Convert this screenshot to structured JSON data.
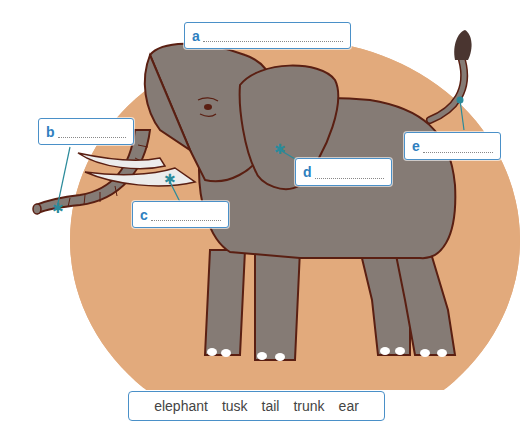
{
  "colors": {
    "background_circle": "#e2aa7c",
    "elephant_body": "#857b75",
    "outline": "#5a1f12",
    "tusk": "#ececec",
    "pointer": "#2a8a9a",
    "label_border": "#4a90c8",
    "label_letter": "#2f7fbf"
  },
  "labels": [
    {
      "letter": "a",
      "target": "whole animal"
    },
    {
      "letter": "b",
      "target": "trunk"
    },
    {
      "letter": "c",
      "target": "tusk"
    },
    {
      "letter": "d",
      "target": "ear"
    },
    {
      "letter": "e",
      "target": "tail"
    }
  ],
  "word_bank": {
    "words": [
      "elephant",
      "tusk",
      "tail",
      "trunk",
      "ear"
    ]
  }
}
